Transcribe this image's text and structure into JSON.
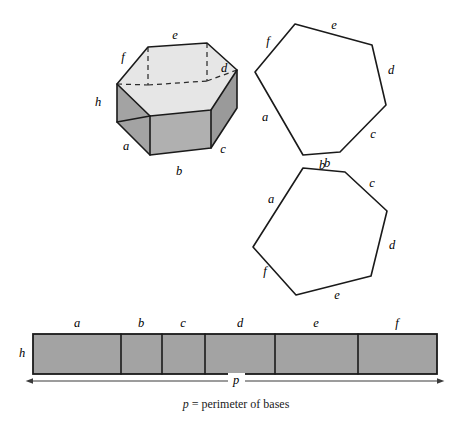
{
  "figure": {
    "caption": "p = perimeter of bases",
    "caption_symbol": "p",
    "caption_rest": " = perimeter of bases",
    "colors": {
      "top_face": "#e6e6e6",
      "side_face": "#a3a3a3",
      "base_face": "#e8e8e8",
      "strip_face": "#a3a3a3",
      "outline": "#1a1a1a",
      "hidden_edge": "#2b2b2b",
      "background": "#ffffff"
    }
  },
  "prism": {
    "name": "hexagonal-prism",
    "height_label": "h",
    "edge_labels": {
      "a": "a",
      "b": "b",
      "c": "c",
      "d": "d",
      "e": "e",
      "f": "f"
    },
    "top_face_points": "117,84 148,47 207,43 237,70 211,110 150,116",
    "bottom_face_points": "117,122 150,155 211,148 237,108 207,81 148,85",
    "left_side_points": "117,84 117,122 150,155 150,116",
    "front_side_points": "150,116 150,155 211,148 211,110",
    "right_side_points": "211,110 211,148 237,108 237,70",
    "hidden_edges": [
      "M 148,47 L 148,85",
      "M 207,43 L 207,81",
      "M 117,84 L 148,85",
      "M 148,85 L 207,81",
      "M 207,81 L 237,70"
    ],
    "visible_edges": [
      "M 117,84 L 148,47 L 207,43 L 237,70 L 211,110 L 150,116 Z",
      "M 117,84 L 117,122 L 150,155 L 211,148 L 237,108 L 237,70",
      "M 150,116 L 150,155",
      "M 211,110 L 211,148",
      "M 117,122 L 150,116"
    ],
    "labels": [
      {
        "text": "e",
        "x": 175,
        "y": 36,
        "name": "prism-edge-label-e"
      },
      {
        "text": "f",
        "x": 123,
        "y": 58,
        "name": "prism-edge-label-f"
      },
      {
        "text": "d",
        "x": 224,
        "y": 69,
        "name": "prism-edge-label-d"
      },
      {
        "text": "h",
        "x": 98,
        "y": 103,
        "name": "prism-height-label-h"
      },
      {
        "text": "a",
        "x": 126,
        "y": 147,
        "name": "prism-edge-label-a"
      },
      {
        "text": "b",
        "x": 179,
        "y": 172,
        "name": "prism-edge-label-b"
      },
      {
        "text": "c",
        "x": 223,
        "y": 150,
        "name": "prism-edge-label-c"
      }
    ]
  },
  "base_top": {
    "name": "top-base-hexagon",
    "points": "295,24 372,45 386,105 340,152 303,155 255,72",
    "labels": [
      {
        "text": "e",
        "x": 334,
        "y": 26,
        "name": "top-base-label-e"
      },
      {
        "text": "f",
        "x": 268,
        "y": 42,
        "name": "top-base-label-f"
      },
      {
        "text": "d",
        "x": 391,
        "y": 71,
        "name": "top-base-label-d"
      },
      {
        "text": "c",
        "x": 373,
        "y": 135,
        "name": "top-base-label-c"
      },
      {
        "text": "b",
        "x": 322,
        "y": 166,
        "name": "top-base-label-b"
      },
      {
        "text": "a",
        "x": 265,
        "y": 118,
        "name": "top-base-label-a"
      }
    ]
  },
  "base_bottom": {
    "name": "bottom-base-hexagon",
    "points": "303,168 345,172 387,211 371,276 296,295 253,247",
    "labels": [
      {
        "text": "b",
        "x": 327,
        "y": 164,
        "name": "bottom-base-label-b"
      },
      {
        "text": "c",
        "x": 372,
        "y": 184,
        "name": "bottom-base-label-c"
      },
      {
        "text": "d",
        "x": 392,
        "y": 246,
        "name": "bottom-base-label-d"
      },
      {
        "text": "e",
        "x": 337,
        "y": 296,
        "name": "bottom-base-label-e"
      },
      {
        "text": "f",
        "x": 265,
        "y": 272,
        "name": "bottom-base-label-f"
      },
      {
        "text": "a",
        "x": 271,
        "y": 200,
        "name": "bottom-base-label-a"
      }
    ]
  },
  "strip": {
    "name": "lateral-surface-strip",
    "x": 33,
    "y": 334,
    "width": 404,
    "height": 40,
    "height_label": "h",
    "height_label_x": 22,
    "height_label_y": 354,
    "dividers": [
      121,
      162,
      205,
      275,
      358
    ],
    "segments": [
      {
        "label": "a",
        "start": 33,
        "end": 121,
        "center": 77,
        "name": "strip-segment-a"
      },
      {
        "label": "b",
        "start": 121,
        "end": 162,
        "center": 141,
        "name": "strip-segment-b"
      },
      {
        "label": "c",
        "start": 162,
        "end": 205,
        "center": 183,
        "name": "strip-segment-c"
      },
      {
        "label": "d",
        "start": 205,
        "end": 275,
        "center": 240,
        "name": "strip-segment-d"
      },
      {
        "label": "e",
        "start": 275,
        "end": 358,
        "center": 316,
        "name": "strip-segment-e"
      },
      {
        "label": "f",
        "start": 358,
        "end": 437,
        "center": 397,
        "name": "strip-segment-f"
      }
    ],
    "segment_label_y": 324
  },
  "dimension": {
    "name": "perimeter-dimension",
    "label": "p",
    "label_x": 236,
    "label_y": 381,
    "y": 381,
    "x_start": 33,
    "x_end": 437
  },
  "caption": {
    "x": 236,
    "y": 405
  }
}
